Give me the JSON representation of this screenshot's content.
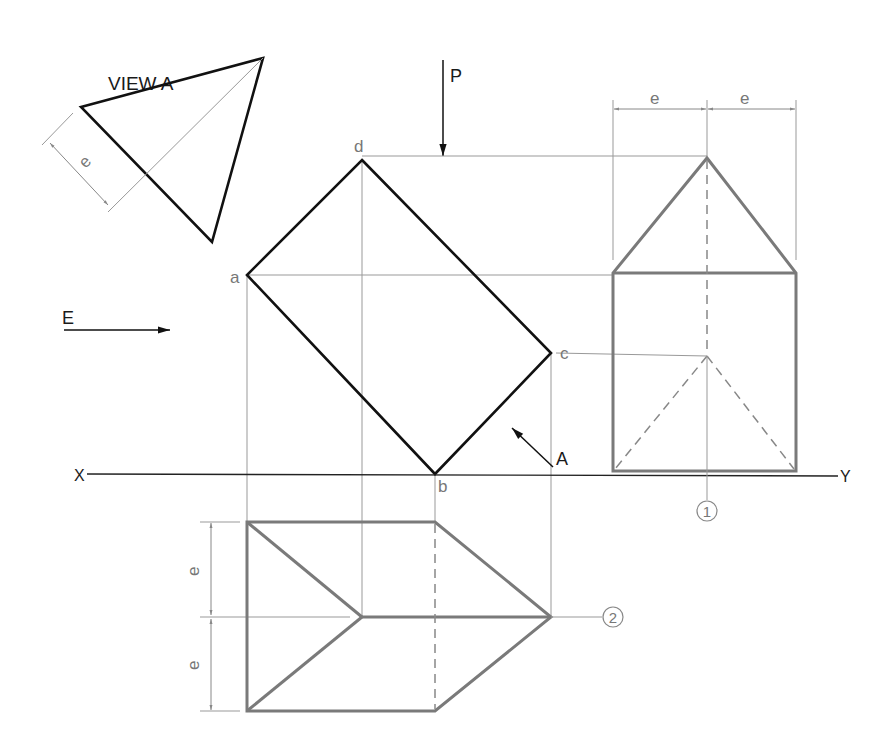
{
  "drawing": {
    "view_a_title": "VIEW A",
    "arrow_p_label": "P",
    "arrow_e_label": "E",
    "arrow_a_label": "A",
    "axis_x_label": "X",
    "axis_y_label": "Y",
    "corner_labels": {
      "a": "a",
      "b": "b",
      "c": "c",
      "d": "d"
    },
    "dimension_label": "e",
    "balloon_1": "1",
    "balloon_2": "2",
    "colors": {
      "object_line": "#111111",
      "projected_line": "#7a7a7a",
      "construction_line": "#999999"
    }
  }
}
